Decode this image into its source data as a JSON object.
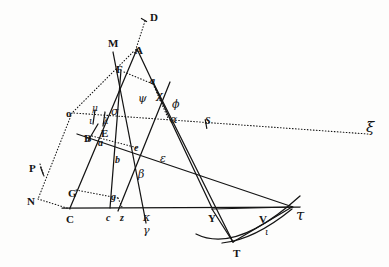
{
  "figure": {
    "kind": "classical-geometry-plate",
    "ink_color": "#141414",
    "paper_color": "#fdfdfc",
    "width": 389,
    "height": 267
  },
  "labels": [
    {
      "id": "D",
      "text": "D",
      "x": 150,
      "y": 12,
      "style": "lat"
    },
    {
      "id": "M",
      "text": "M",
      "x": 108,
      "y": 38,
      "style": "lat"
    },
    {
      "id": "A",
      "text": "A",
      "x": 135,
      "y": 45,
      "style": "lat"
    },
    {
      "id": "F",
      "text": "F",
      "x": 116,
      "y": 64,
      "style": "lat"
    },
    {
      "id": "a-upper",
      "text": "a",
      "x": 150,
      "y": 76,
      "style": "lat-it"
    },
    {
      "id": "psi",
      "text": "ψ",
      "x": 138,
      "y": 93,
      "style": "grk"
    },
    {
      "id": "chi",
      "text": "χ",
      "x": 156,
      "y": 90,
      "style": "grk"
    },
    {
      "id": "phi",
      "text": "ϕ",
      "x": 172,
      "y": 99,
      "style": "grk"
    },
    {
      "id": "alpha",
      "text": "α",
      "x": 170,
      "y": 114,
      "style": "grk"
    },
    {
      "id": "o",
      "text": "o",
      "x": 66,
      "y": 108,
      "style": "lat"
    },
    {
      "id": "mu",
      "text": "μ",
      "x": 92,
      "y": 104,
      "style": "grk-sm"
    },
    {
      "id": "sigma",
      "text": "σ",
      "x": 111,
      "y": 106,
      "style": "grk"
    },
    {
      "id": "iota",
      "text": "ι",
      "x": 89,
      "y": 117,
      "style": "grk-sm"
    },
    {
      "id": "lambda",
      "text": "λ",
      "x": 103,
      "y": 117,
      "style": "grk-sm"
    },
    {
      "id": "E",
      "text": "E",
      "x": 101,
      "y": 128,
      "style": "lat"
    },
    {
      "id": "B",
      "text": "B",
      "x": 84,
      "y": 133,
      "style": "lat"
    },
    {
      "id": "a-lower",
      "text": "a",
      "x": 98,
      "y": 138,
      "style": "lat-it"
    },
    {
      "id": "e",
      "text": "e",
      "x": 134,
      "y": 143,
      "style": "lat-it"
    },
    {
      "id": "b",
      "text": "b",
      "x": 115,
      "y": 155,
      "style": "lat-it"
    },
    {
      "id": "epsilon",
      "text": "ε",
      "x": 160,
      "y": 153,
      "style": "grk"
    },
    {
      "id": "beta",
      "text": "β",
      "x": 138,
      "y": 169,
      "style": "grk"
    },
    {
      "id": "P",
      "text": "P",
      "x": 29,
      "y": 163,
      "style": "lat"
    },
    {
      "id": "N",
      "text": "N",
      "x": 27,
      "y": 196,
      "style": "lat"
    },
    {
      "id": "G",
      "text": "G",
      "x": 68,
      "y": 188,
      "style": "lat"
    },
    {
      "id": "g",
      "text": "g",
      "x": 111,
      "y": 192,
      "style": "lat-it"
    },
    {
      "id": "C",
      "text": "C",
      "x": 66,
      "y": 214,
      "style": "lat"
    },
    {
      "id": "c",
      "text": "c",
      "x": 106,
      "y": 213,
      "style": "lat-it"
    },
    {
      "id": "z",
      "text": "z",
      "x": 120,
      "y": 213,
      "style": "lat-it"
    },
    {
      "id": "kappa",
      "text": "κ",
      "x": 143,
      "y": 212,
      "style": "grk"
    },
    {
      "id": "gamma",
      "text": "γ",
      "x": 143,
      "y": 225,
      "style": "grk"
    },
    {
      "id": "S",
      "text": "S",
      "x": 205,
      "y": 116,
      "style": "lat-it"
    },
    {
      "id": "xi",
      "text": "ξ",
      "x": 366,
      "y": 120,
      "style": "grk-lg"
    },
    {
      "id": "Y",
      "text": "Y",
      "x": 208,
      "y": 213,
      "style": "lat"
    },
    {
      "id": "V",
      "text": "V",
      "x": 259,
      "y": 214,
      "style": "lat"
    },
    {
      "id": "tau",
      "text": "τ",
      "x": 296,
      "y": 208,
      "style": "grk-lg"
    },
    {
      "id": "T",
      "text": "T",
      "x": 233,
      "y": 248,
      "style": "lat"
    },
    {
      "id": "iota2",
      "text": "ι",
      "x": 265,
      "y": 228,
      "style": "grk-sm"
    }
  ],
  "points": {
    "D": [
      146,
      18
    ],
    "A": [
      137,
      52
    ],
    "M": [
      113,
      46
    ],
    "F": [
      121,
      72
    ],
    "o": [
      73,
      112
    ],
    "N": [
      37,
      201
    ],
    "P": [
      42,
      170
    ],
    "C": [
      70,
      208
    ],
    "G": [
      73,
      189
    ],
    "B": [
      90,
      137
    ],
    "E": [
      102,
      133
    ],
    "c": [
      110,
      208
    ],
    "z": [
      120,
      208
    ],
    "g": [
      112,
      196
    ],
    "kappa": [
      140,
      208
    ],
    "gamma": [
      144,
      222
    ],
    "a_up": [
      153,
      82
    ],
    "chi": [
      163,
      95
    ],
    "alpha": [
      168,
      120
    ],
    "Y": [
      212,
      208
    ],
    "T": [
      233,
      242
    ],
    "V": [
      262,
      222
    ],
    "tau": [
      292,
      208
    ],
    "S": [
      206,
      124
    ],
    "xi": [
      362,
      132
    ]
  },
  "solid_lines": [
    {
      "name": "line-M-kappa",
      "from": [
        113,
        52
      ],
      "to": [
        146,
        223
      ]
    },
    {
      "name": "line-A-C",
      "from": [
        137,
        49
      ],
      "to": [
        70,
        208
      ]
    },
    {
      "name": "line-A-Y",
      "from": [
        137,
        49
      ],
      "to": [
        212,
        208
      ]
    },
    {
      "name": "line-B-tau",
      "from": [
        77,
        134
      ],
      "to": [
        293,
        207
      ]
    },
    {
      "name": "line-aup-T",
      "from": [
        152,
        80
      ],
      "to": [
        233,
        242
      ]
    },
    {
      "name": "line-F-c",
      "from": [
        121,
        70
      ],
      "to": [
        110,
        208
      ]
    },
    {
      "name": "line-chi-z",
      "from": [
        170,
        82
      ],
      "to": [
        118,
        211
      ]
    },
    {
      "name": "baseline-C-tau",
      "from": [
        62,
        208
      ],
      "to": [
        300,
        207
      ]
    },
    {
      "name": "line-Y-tau-chord",
      "from": [
        212,
        209
      ],
      "to": [
        292,
        207
      ]
    },
    {
      "name": "line-Y-T",
      "from": [
        212,
        209
      ],
      "to": [
        233,
        242
      ]
    },
    {
      "name": "line-T-tau",
      "from": [
        233,
        242
      ],
      "to": [
        292,
        207
      ]
    },
    {
      "name": "line-E-B-short",
      "from": [
        98,
        124
      ],
      "to": [
        88,
        141
      ]
    },
    {
      "name": "line-lambda-drop",
      "from": [
        105,
        112
      ],
      "to": [
        103,
        126
      ]
    },
    {
      "name": "line-mu-drop",
      "from": [
        95,
        110
      ],
      "to": [
        93,
        124
      ]
    }
  ],
  "dotted_lines": [
    {
      "name": "dotted-D-A",
      "from": [
        145,
        21
      ],
      "to": [
        134,
        55
      ]
    },
    {
      "name": "dotted-M-o",
      "from": [
        133,
        52
      ],
      "to": [
        72,
        113
      ]
    },
    {
      "name": "dotted-o-N",
      "from": [
        72,
        113
      ],
      "to": [
        38,
        199
      ]
    },
    {
      "name": "dotted-N-C",
      "from": [
        38,
        199
      ],
      "to": [
        70,
        209
      ]
    },
    {
      "name": "dotted-o-S-xi",
      "from": [
        74,
        113
      ],
      "to": [
        368,
        134
      ]
    },
    {
      "name": "dotted-F-aup",
      "from": [
        124,
        72
      ],
      "to": [
        153,
        84
      ]
    },
    {
      "name": "dotted-aup-chi",
      "from": [
        153,
        84
      ],
      "to": [
        168,
        118
      ]
    },
    {
      "name": "dotted-B-e",
      "from": [
        92,
        136
      ],
      "to": [
        138,
        148
      ]
    },
    {
      "name": "dotted-G-g",
      "from": [
        76,
        190
      ],
      "to": [
        118,
        198
      ]
    },
    {
      "name": "dotted-g-z",
      "from": [
        118,
        198
      ],
      "to": [
        122,
        207
      ]
    },
    {
      "name": "dotted-P-tick",
      "from": [
        40,
        164
      ],
      "to": [
        44,
        176
      ]
    }
  ],
  "curves": [
    {
      "name": "parabola-outer",
      "path": "M 196 234 Q 236 254 300 196"
    },
    {
      "name": "parabola-inner",
      "path": "M 222 243 Q 254 240 292 209"
    }
  ],
  "ticks": [
    {
      "name": "tick-S",
      "x": 206,
      "y": 124,
      "len": 9,
      "angle": 80
    },
    {
      "name": "tick-P",
      "x": 42,
      "y": 171,
      "len": 8,
      "angle": 70
    },
    {
      "name": "tick-D",
      "x": 144,
      "y": 20,
      "len": 6,
      "angle": 30
    }
  ]
}
